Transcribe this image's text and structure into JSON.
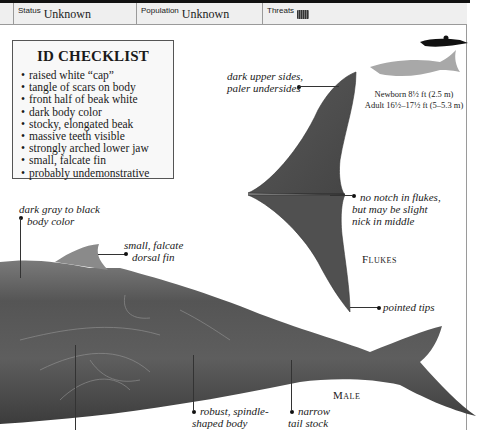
{
  "header": {
    "status_label": "Status",
    "status_value": "Unknown",
    "population_label": "Population",
    "population_value": "Unknown",
    "threats_label": "Threats",
    "threats_icon": "net-icon"
  },
  "checklist": {
    "title": "ID CHECKLIST",
    "items": [
      "raised white “cap”",
      "tangle of scars on body",
      "front half of beak white",
      "dark body color",
      "stocky, elongated beak",
      "massive teeth visible",
      "strongly arched lower jaw",
      "small, falcate fin",
      "probably undemonstrative"
    ]
  },
  "size": {
    "newborn": "Newborn 8½ ft (2.5 m)",
    "adult": "Adult 16½–17½ ft (5–5.3 m)"
  },
  "annotations": {
    "upper_sides_1": "dark upper sides,",
    "upper_sides_2": "paler undersides",
    "no_notch_1": "no notch in flukes,",
    "no_notch_2": "but may be slight",
    "no_notch_3": "nick in middle",
    "flukes_label": "Flukes",
    "pointed_tips": "pointed tips",
    "body_color_1": "dark gray to black",
    "body_color_2": "body color",
    "dorsal_1": "small, falcate",
    "dorsal_2": "dorsal fin",
    "male_label": "Male",
    "robust_1": "robust, spindle-",
    "robust_2": "shaped body",
    "narrow_1": "narrow",
    "narrow_2": "tail stock"
  },
  "colors": {
    "whale_dark": "#4a4a4a",
    "whale_mid": "#6b6b6b",
    "silhouette": "#a8a8a8",
    "header_bg": "#efefef"
  }
}
